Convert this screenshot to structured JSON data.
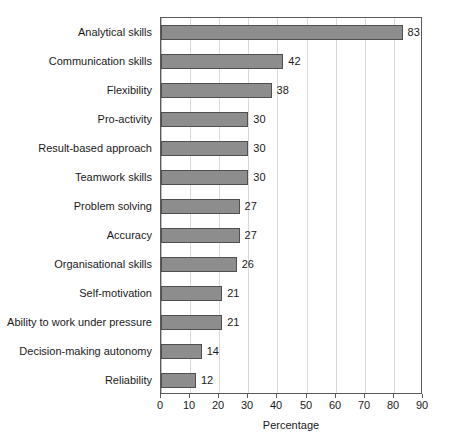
{
  "chart_data": {
    "type": "bar",
    "orientation": "horizontal",
    "title": "",
    "xlabel": "Percentage",
    "ylabel": "",
    "xlim": [
      0,
      90
    ],
    "xticks": [
      0,
      10,
      20,
      30,
      40,
      50,
      60,
      70,
      80,
      90
    ],
    "grid": "vertical",
    "legend": "none",
    "bar_color": "#8d8d8d",
    "bar_border_color": "#4f4f4f",
    "categories": [
      "Analytical skills",
      "Communication skills",
      "Flexibility",
      "Pro-activity",
      "Result-based approach",
      "Teamwork skills",
      "Problem solving",
      "Accuracy",
      "Organisational skills",
      "Self-motivation",
      "Ability to work under pressure",
      "Decision-making autonomy",
      "Reliability"
    ],
    "values": [
      83,
      42,
      38,
      30,
      30,
      30,
      27,
      27,
      26,
      21,
      21,
      14,
      12
    ],
    "data_labels": [
      "83",
      "42",
      "38",
      "30",
      "30",
      "30",
      "27",
      "27",
      "26",
      "21",
      "21",
      "14",
      "12"
    ],
    "tick_labels": [
      "0",
      "10",
      "20",
      "30",
      "40",
      "50",
      "60",
      "70",
      "80",
      "90"
    ]
  }
}
